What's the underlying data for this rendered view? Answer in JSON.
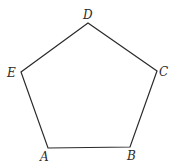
{
  "diagram": {
    "type": "regular-pentagon",
    "stroke_color": "#2a2a2a",
    "background": "#ffffff",
    "vertices": [
      {
        "name": "A",
        "x": 48,
        "y": 148,
        "label_x": 40,
        "label_y": 161
      },
      {
        "name": "B",
        "x": 130,
        "y": 147,
        "label_x": 127,
        "label_y": 160
      },
      {
        "name": "C",
        "x": 157,
        "y": 71,
        "label_x": 159,
        "label_y": 76
      },
      {
        "name": "D",
        "x": 88,
        "y": 23,
        "label_x": 83,
        "label_y": 19
      },
      {
        "name": "E",
        "x": 21,
        "y": 72,
        "label_x": 7,
        "label_y": 77
      }
    ],
    "polygon_points": "48,148 130,147 157,71 88,23 21,72"
  }
}
